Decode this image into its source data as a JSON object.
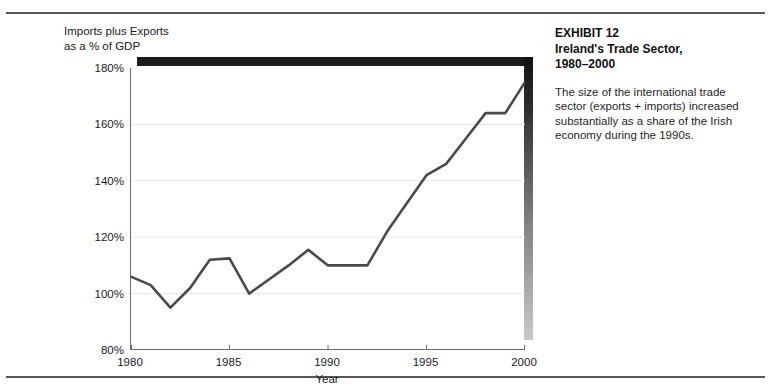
{
  "exhibit": {
    "title_line1": "EXHIBIT 12",
    "title_line2": "Ireland's Trade Sector,",
    "title_line3": "1980–2000",
    "caption": "The size of the international trade sector (exports + imports) increased substantially as a share of the Irish economy during the 1990s."
  },
  "chart_data": {
    "type": "line",
    "xlabel": "Year",
    "ylabel": "Imports plus Exports\nas a % of GDP",
    "xlim": [
      1980,
      2000
    ],
    "ylim": [
      80,
      180
    ],
    "ytick_step": 20,
    "xtick_step": 5,
    "grid": true,
    "grid_color": "#e8e8e8",
    "line_color": "#4a4a4a",
    "legend": null,
    "ytick_labels": [
      "80%",
      "100%",
      "120%",
      "140%",
      "160%",
      "180%"
    ],
    "ytick_values": [
      80,
      100,
      120,
      140,
      160,
      180
    ],
    "xtick_labels": [
      "1980",
      "1985",
      "1990",
      "1995",
      "2000"
    ],
    "xtick_values": [
      1980,
      1985,
      1990,
      1995,
      2000
    ],
    "x": [
      1980,
      1981,
      1982,
      1983,
      1984,
      1985,
      1986,
      1987,
      1988,
      1989,
      1990,
      1991,
      1992,
      1993,
      1994,
      1995,
      1996,
      1997,
      1998,
      1999,
      2000
    ],
    "values": [
      106,
      103,
      95,
      102,
      112,
      112.5,
      100,
      105,
      110,
      115.5,
      110,
      110,
      110,
      122,
      132,
      142,
      146,
      155,
      164,
      164,
      175
    ]
  }
}
